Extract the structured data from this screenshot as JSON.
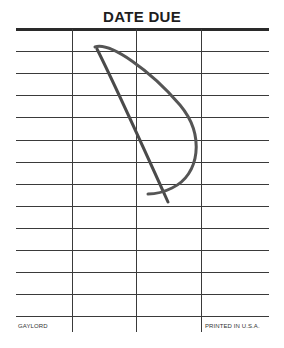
{
  "card": {
    "title": "DATE DUE",
    "footer_left": "GAYLORD",
    "footer_right": "PRINTED IN U.S.A.",
    "columns": 4,
    "rows": 13,
    "entries": [
      {
        "row": 1,
        "column": 2,
        "text": "D",
        "style": "handwritten"
      }
    ]
  }
}
